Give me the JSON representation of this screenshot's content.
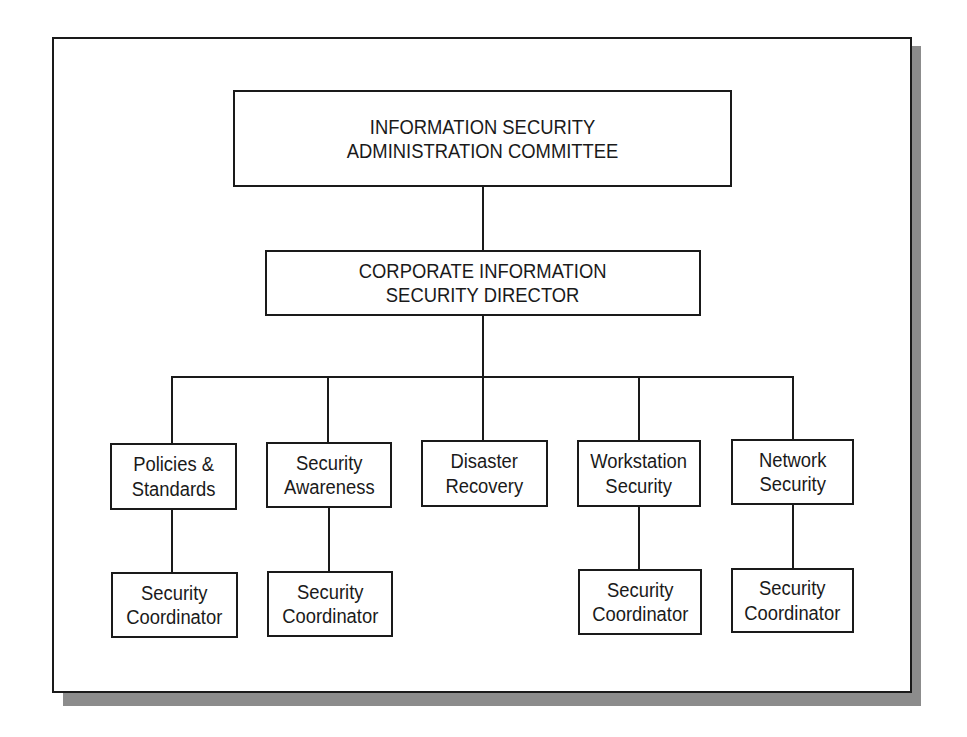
{
  "diagram": {
    "type": "org-chart",
    "top": {
      "label": "INFORMATION SECURITY\nADMINISTRATION COMMITTEE"
    },
    "director": {
      "label": "CORPORATE INFORMATION\nSECURITY DIRECTOR"
    },
    "departments": [
      {
        "label": "Policies &\nStandards",
        "coordinator": "Security\nCoordinator"
      },
      {
        "label": "Security\nAwareness",
        "coordinator": "Security\nCoordinator"
      },
      {
        "label": "Disaster\nRecovery",
        "coordinator": null
      },
      {
        "label": "Workstation\nSecurity",
        "coordinator": "Security\nCoordinator"
      },
      {
        "label": "Network\nSecurity",
        "coordinator": "Security\nCoordinator"
      }
    ],
    "colors": {
      "line": "#1a1a1a",
      "shadow": "#8c8c8c",
      "background": "#ffffff"
    }
  }
}
